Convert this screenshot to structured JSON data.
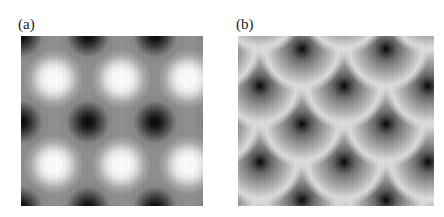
{
  "figure": {
    "type": "two-panel grayscale scanning-probe / charge-density map",
    "background_color": "#ffffff",
    "width_px": 444,
    "height_px": 217
  },
  "panels": [
    {
      "label": "(a)",
      "label_name": "panel-label-a",
      "lattice": "square",
      "description": "Square lattice grayscale map: dark atomic maxima on a checkerboard square lattice with bright diamond-shaped interstitial regions between them.",
      "bounds_px": {
        "x": 21,
        "y": 36,
        "width": 182,
        "height": 170
      },
      "lattice_period_x_px": 67,
      "lattice_period_y_px": 86,
      "dark_site_color": "#050505",
      "bright_site_color": "#ffffff",
      "background_level_color": "#8f8f8f",
      "dark_sites_px": [
        [
          0,
          0
        ],
        [
          67,
          0
        ],
        [
          134,
          0
        ],
        [
          201,
          0
        ],
        [
          0,
          86
        ],
        [
          67,
          86
        ],
        [
          134,
          86
        ],
        [
          201,
          86
        ],
        [
          0,
          172
        ],
        [
          67,
          172
        ],
        [
          134,
          172
        ],
        [
          201,
          172
        ]
      ],
      "bright_sites_px": [
        [
          -34,
          -43
        ],
        [
          33,
          -43
        ],
        [
          100,
          -43
        ],
        [
          167,
          -43
        ],
        [
          -34,
          43
        ],
        [
          33,
          43
        ],
        [
          100,
          43
        ],
        [
          167,
          43
        ],
        [
          -34,
          129
        ],
        [
          33,
          129
        ],
        [
          100,
          129
        ],
        [
          167,
          129
        ],
        [
          33,
          215
        ],
        [
          100,
          215
        ],
        [
          167,
          215
        ]
      ]
    },
    {
      "label": "(b)",
      "label_name": "panel-label-b",
      "lattice": "hexagonal",
      "description": "Hexagonal (triangular) lattice grayscale map: large circular gray blobs each with a sharp black core, separated by near-white interstitial channels.",
      "bounds_px": {
        "x": 238,
        "y": 36,
        "width": 196,
        "height": 170
      },
      "lattice_period_x_px": 84,
      "row_offset_x_px": 42,
      "row_spacing_y_px": 38,
      "blob_radius_px": 44,
      "dark_core_color": "#000000",
      "interstitial_color": "#f4f4f4",
      "background_level_color": "#f4f4f4",
      "blob_centers_px": [
        [
          22,
          -25
        ],
        [
          106,
          -25
        ],
        [
          190,
          -25
        ],
        [
          -20,
          13
        ],
        [
          64,
          13
        ],
        [
          148,
          13
        ],
        [
          22,
          50
        ],
        [
          106,
          50
        ],
        [
          190,
          50
        ],
        [
          -20,
          88
        ],
        [
          64,
          88
        ],
        [
          148,
          88
        ],
        [
          22,
          126
        ],
        [
          106,
          126
        ],
        [
          190,
          126
        ],
        [
          -20,
          164
        ],
        [
          64,
          164
        ],
        [
          148,
          164
        ],
        [
          22,
          200
        ],
        [
          106,
          200
        ],
        [
          190,
          200
        ]
      ]
    }
  ],
  "colors": {
    "page_background": "#ffffff",
    "label_text": "#1a1a1a",
    "grayscale_min": "#000000",
    "grayscale_max": "#ffffff"
  }
}
